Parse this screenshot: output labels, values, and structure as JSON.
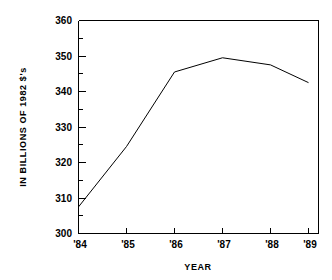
{
  "chart_data": {
    "type": "line",
    "title": "",
    "xlabel": "YEAR",
    "ylabel": "IN BILLIONS OF 1982 $'s",
    "categories": [
      "'84",
      "'85",
      "'86",
      "'87",
      "'88",
      "'89"
    ],
    "values": [
      307.5,
      324.5,
      345.5,
      349.5,
      347.5,
      342.5
    ],
    "ylim": [
      300,
      360
    ],
    "ytick_labels": [
      "300",
      "310",
      "320",
      "330",
      "340",
      "350",
      "360"
    ],
    "ytick_values": [
      300,
      310,
      320,
      330,
      340,
      350,
      360
    ],
    "yminor_step": 5,
    "xtick_labels": [
      "'84",
      "'85",
      "'86",
      "'87",
      "'88",
      "'89"
    ],
    "grid": false,
    "legend": null,
    "line_color": "#000000",
    "background_color": "#ffffff"
  },
  "axis": {
    "y_title": "IN BILLIONS OF 1982 $'s",
    "x_title": "YEAR",
    "y_ticks": [
      {
        "label": "360",
        "value": 360
      },
      {
        "label": "350",
        "value": 350
      },
      {
        "label": "340",
        "value": 340
      },
      {
        "label": "330",
        "value": 330
      },
      {
        "label": "320",
        "value": 320
      },
      {
        "label": "310",
        "value": 310
      },
      {
        "label": "300",
        "value": 300
      }
    ],
    "x_ticks": [
      {
        "label": "'84",
        "value": 1984
      },
      {
        "label": "'85",
        "value": 1985
      },
      {
        "label": "'86",
        "value": 1986
      },
      {
        "label": "'87",
        "value": 1987
      },
      {
        "label": "'88",
        "value": 1988
      },
      {
        "label": "'89",
        "value": 1989
      }
    ]
  }
}
